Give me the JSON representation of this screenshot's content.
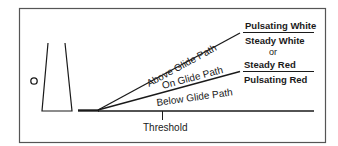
{
  "diagram": {
    "paths": {
      "above": "Above Glide Path",
      "on": "On Glide Path",
      "below": "Below Glide Path"
    },
    "signals": {
      "pulsating_white": "Pulsating White",
      "steady_white": "Steady White",
      "or": "or",
      "steady_red": "Steady Red",
      "pulsating_red": "Pulsating Red"
    },
    "threshold": "Threshold",
    "colors": {
      "line": "#1a1a1a",
      "frame": "#555555",
      "background": "#ffffff"
    }
  }
}
